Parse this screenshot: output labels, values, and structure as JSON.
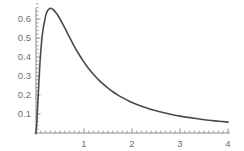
{
  "chart_data": {
    "type": "line",
    "title": "",
    "subtitle": "",
    "xlabel": "",
    "ylabel": "",
    "xlim": [
      0,
      4
    ],
    "ylim": [
      0,
      0.69
    ],
    "grid": false,
    "legend": null,
    "series": [
      {
        "name": "density",
        "color": "#4a4a4a",
        "line_width": 1.6,
        "x": [
          0.0,
          0.02,
          0.05,
          0.08,
          0.1,
          0.12,
          0.15,
          0.18,
          0.2,
          0.22,
          0.25,
          0.28,
          0.3,
          0.32,
          0.35,
          0.38,
          0.4,
          0.45,
          0.5,
          0.55,
          0.6,
          0.65,
          0.7,
          0.75,
          0.8,
          0.85,
          0.9,
          0.95,
          1.0,
          1.1,
          1.2,
          1.3,
          1.4,
          1.5,
          1.6,
          1.7,
          1.8,
          1.9,
          2.0,
          2.2,
          2.4,
          2.6,
          2.8,
          3.0,
          3.2,
          3.4,
          3.6,
          3.8,
          4.0
        ],
        "y": [
          0.0,
          0.07,
          0.22,
          0.36,
          0.43,
          0.49,
          0.55,
          0.59,
          0.615,
          0.632,
          0.647,
          0.654,
          0.656,
          0.655,
          0.651,
          0.644,
          0.638,
          0.621,
          0.6,
          0.577,
          0.553,
          0.528,
          0.503,
          0.479,
          0.455,
          0.433,
          0.412,
          0.392,
          0.373,
          0.338,
          0.308,
          0.281,
          0.257,
          0.236,
          0.217,
          0.201,
          0.186,
          0.173,
          0.161,
          0.141,
          0.124,
          0.111,
          0.099,
          0.089,
          0.081,
          0.074,
          0.067,
          0.062,
          0.057
        ]
      }
    ],
    "x_axis": {
      "major_ticks": [
        1,
        2,
        3,
        4
      ],
      "major_tick_labels": [
        "1",
        "2",
        "3",
        "4"
      ],
      "minor_tick_step": 0.1,
      "axis_color": "#8a8a8a"
    },
    "y_axis": {
      "major_ticks": [
        0.1,
        0.2,
        0.3,
        0.4,
        0.5,
        0.6
      ],
      "major_tick_labels": [
        "0.1",
        "0.2",
        "0.3",
        "0.4",
        "0.5",
        "0.6"
      ],
      "minor_tick_step": 0.02,
      "axis_color": "#8a8a8a"
    },
    "peak": {
      "x": 0.3,
      "y": 0.656
    },
    "geometry": {
      "origin_x": 36,
      "origin_y": 133,
      "px_per_x_unit": 48,
      "px_per_y_unit": 190,
      "y_axis_top": 8,
      "x_axis_right": 230
    },
    "background_color": "#ffffff"
  }
}
